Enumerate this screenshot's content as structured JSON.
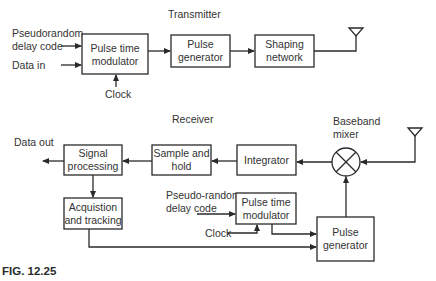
{
  "figure": {
    "caption": "FIG. 12.25",
    "transmitter": {
      "title": "Transmitter",
      "inputs": {
        "code_line1": "Pseudorandom",
        "code_line2": "delay code",
        "data_in": "Data in",
        "clock": "Clock"
      },
      "blocks": {
        "ptm": [
          "Pulse time",
          "modulator"
        ],
        "pulse_gen": [
          "Pulse",
          "generator"
        ],
        "shaping": [
          "Shaping",
          "network"
        ]
      }
    },
    "receiver": {
      "title": "Receiver",
      "data_out": "Data out",
      "mixer_label": [
        "Baseband",
        "mixer"
      ],
      "blocks": {
        "signal_proc": [
          "Signal",
          "processing"
        ],
        "sample_hold": [
          "Sample and",
          "hold"
        ],
        "integrator": [
          "Integrator"
        ],
        "acq": [
          "Acquistion",
          "and tracking"
        ],
        "ptm": [
          "Pulse time",
          "modulator"
        ],
        "pulse_gen": [
          "Pulse",
          "generator"
        ]
      },
      "inputs": {
        "code_line1": "Pseudo-random",
        "code_line2": "delay code",
        "clock": "Clock"
      }
    }
  }
}
